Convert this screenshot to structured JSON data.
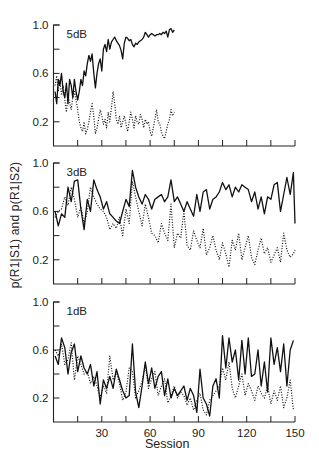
{
  "figure": {
    "ylabel": "p(R1|S1) and p(R1|S2)",
    "xlabel": "Session"
  },
  "chart_data": [
    {
      "type": "line",
      "title": "5 dB",
      "xlabel": "Session",
      "ylabel": "p(R1|S1) and p(R1|S2)",
      "xlim": [
        0,
        150
      ],
      "ylim": [
        0,
        1.0
      ],
      "yticks": [
        0.2,
        0.4,
        0.6,
        0.8,
        1.0
      ],
      "ytick_labels": [
        "0.2",
        "",
        "0.6",
        "",
        "1.0"
      ],
      "xticks": [
        15,
        30,
        45,
        60,
        75,
        90,
        105,
        120,
        135,
        150
      ],
      "xtick_labels": [],
      "grid": false,
      "series": [
        {
          "name": "p(R1|S1)",
          "style": "solid",
          "x": [
            1,
            2,
            3,
            4,
            5,
            6,
            7,
            8,
            9,
            10,
            11,
            12,
            13,
            14,
            15,
            16,
            17,
            18,
            19,
            20,
            21,
            22,
            23,
            24,
            25,
            26,
            27,
            28,
            29,
            30,
            31,
            32,
            33,
            34,
            35,
            36,
            37,
            38,
            39,
            40,
            41,
            42,
            43,
            44,
            45,
            46,
            47,
            48,
            49,
            50,
            51,
            52,
            53,
            54,
            55,
            56,
            57,
            58,
            59,
            60,
            61,
            62,
            63,
            64,
            65,
            66,
            67,
            68,
            69,
            70,
            71,
            72,
            73,
            74,
            75
          ],
          "values": [
            0.45,
            0.35,
            0.55,
            0.5,
            0.6,
            0.45,
            0.4,
            0.52,
            0.35,
            0.55,
            0.5,
            0.4,
            0.55,
            0.45,
            0.38,
            0.45,
            0.55,
            0.5,
            0.62,
            0.58,
            0.68,
            0.75,
            0.7,
            0.76,
            0.6,
            0.48,
            0.6,
            0.68,
            0.72,
            0.62,
            0.8,
            0.84,
            0.78,
            0.88,
            0.8,
            0.86,
            0.88,
            0.9,
            0.87,
            0.85,
            0.83,
            0.79,
            0.72,
            0.85,
            0.9,
            0.89,
            0.87,
            0.88,
            0.84,
            0.82,
            0.85,
            0.84,
            0.86,
            0.87,
            0.88,
            0.9,
            0.94,
            0.92,
            0.9,
            0.92,
            0.93,
            0.92,
            0.91,
            0.92,
            0.92,
            0.93,
            0.92,
            0.94,
            0.93,
            0.95,
            0.9,
            0.96,
            0.97,
            0.94,
            0.96
          ]
        },
        {
          "name": "p(R1|S2)",
          "style": "dotted",
          "x": [
            1,
            2,
            3,
            4,
            5,
            6,
            7,
            8,
            9,
            10,
            11,
            12,
            13,
            14,
            15,
            16,
            17,
            18,
            19,
            20,
            21,
            22,
            23,
            24,
            25,
            26,
            27,
            28,
            29,
            30,
            31,
            32,
            33,
            34,
            35,
            36,
            37,
            38,
            39,
            40,
            41,
            42,
            43,
            44,
            45,
            46,
            47,
            48,
            49,
            50,
            51,
            52,
            53,
            54,
            55,
            56,
            57,
            58,
            59,
            60,
            61,
            62,
            63,
            64,
            65,
            66,
            67,
            68,
            69,
            70,
            71,
            72,
            73,
            74,
            75
          ],
          "values": [
            0.5,
            0.58,
            0.45,
            0.55,
            0.42,
            0.5,
            0.38,
            0.28,
            0.42,
            0.36,
            0.3,
            0.4,
            0.45,
            0.38,
            0.3,
            0.2,
            0.15,
            0.12,
            0.2,
            0.1,
            0.14,
            0.2,
            0.28,
            0.35,
            0.25,
            0.1,
            0.15,
            0.22,
            0.3,
            0.25,
            0.18,
            0.22,
            0.15,
            0.28,
            0.2,
            0.32,
            0.45,
            0.35,
            0.22,
            0.18,
            0.25,
            0.15,
            0.2,
            0.25,
            0.18,
            0.12,
            0.2,
            0.28,
            0.22,
            0.15,
            0.25,
            0.2,
            0.18,
            0.26,
            0.22,
            0.15,
            0.22,
            0.18,
            0.2,
            0.12,
            0.08,
            0.15,
            0.22,
            0.3,
            0.2,
            0.18,
            0.12,
            0.08,
            0.06,
            0.12,
            0.18,
            0.22,
            0.3,
            0.25,
            0.28
          ]
        }
      ]
    },
    {
      "type": "line",
      "title": "3 dB",
      "xlabel": "Session",
      "ylabel": "p(R1|S1) and p(R1|S2)",
      "xlim": [
        0,
        150
      ],
      "ylim": [
        0,
        1.0
      ],
      "yticks": [
        0.2,
        0.4,
        0.6,
        0.8,
        1.0
      ],
      "ytick_labels": [
        "0.2",
        "",
        "0.6",
        "",
        "1.0"
      ],
      "xticks": [
        15,
        30,
        45,
        60,
        75,
        90,
        105,
        120,
        135,
        150
      ],
      "xtick_labels": [],
      "grid": false,
      "series": [
        {
          "name": "p(R1|S1)",
          "style": "solid",
          "x": [
            1,
            3,
            5,
            7,
            9,
            11,
            13,
            15,
            17,
            19,
            21,
            23,
            25,
            27,
            29,
            31,
            33,
            35,
            37,
            39,
            41,
            43,
            45,
            47,
            49,
            51,
            53,
            55,
            57,
            59,
            61,
            63,
            65,
            67,
            69,
            71,
            73,
            75,
            77,
            79,
            81,
            83,
            85,
            87,
            89,
            91,
            93,
            95,
            97,
            99,
            101,
            103,
            105,
            107,
            109,
            111,
            113,
            115,
            117,
            119,
            121,
            123,
            125,
            127,
            129,
            131,
            133,
            135,
            137,
            139,
            141,
            143,
            145,
            147,
            149,
            150
          ],
          "values": [
            0.6,
            0.48,
            0.58,
            0.55,
            0.8,
            0.68,
            0.85,
            0.86,
            0.62,
            0.45,
            0.7,
            0.6,
            0.86,
            0.78,
            0.72,
            0.62,
            0.68,
            0.58,
            0.55,
            0.52,
            0.5,
            0.6,
            0.7,
            0.64,
            0.94,
            0.8,
            0.72,
            0.66,
            0.74,
            0.7,
            0.62,
            0.7,
            0.72,
            0.74,
            0.68,
            0.72,
            0.86,
            0.68,
            0.72,
            0.66,
            0.6,
            0.68,
            0.62,
            0.56,
            0.74,
            0.6,
            0.76,
            0.78,
            0.62,
            0.7,
            0.72,
            0.76,
            0.84,
            0.78,
            0.82,
            0.72,
            0.8,
            0.76,
            0.82,
            0.8,
            0.78,
            0.68,
            0.76,
            0.62,
            0.72,
            0.58,
            0.72,
            0.7,
            0.82,
            0.84,
            0.6,
            0.74,
            0.88,
            0.74,
            0.92,
            0.5
          ]
        },
        {
          "name": "p(R1|S2)",
          "style": "dotted",
          "x": [
            1,
            3,
            5,
            7,
            9,
            11,
            13,
            15,
            17,
            19,
            21,
            23,
            25,
            27,
            29,
            31,
            33,
            35,
            37,
            39,
            41,
            43,
            45,
            47,
            49,
            51,
            53,
            55,
            57,
            59,
            61,
            63,
            65,
            67,
            69,
            71,
            73,
            75,
            77,
            79,
            81,
            83,
            85,
            87,
            89,
            91,
            93,
            95,
            97,
            99,
            101,
            103,
            105,
            107,
            109,
            111,
            113,
            115,
            117,
            119,
            121,
            123,
            125,
            127,
            129,
            131,
            133,
            135,
            137,
            139,
            141,
            143,
            145,
            147,
            149,
            150
          ],
          "values": [
            0.55,
            0.6,
            0.62,
            0.72,
            0.65,
            0.8,
            0.7,
            0.55,
            0.64,
            0.5,
            0.6,
            0.8,
            0.72,
            0.66,
            0.62,
            0.6,
            0.55,
            0.45,
            0.5,
            0.46,
            0.55,
            0.4,
            0.62,
            0.5,
            0.85,
            0.72,
            0.6,
            0.48,
            0.66,
            0.55,
            0.42,
            0.4,
            0.34,
            0.5,
            0.42,
            0.36,
            0.66,
            0.3,
            0.42,
            0.38,
            0.6,
            0.32,
            0.28,
            0.44,
            0.36,
            0.3,
            0.46,
            0.24,
            0.3,
            0.4,
            0.28,
            0.2,
            0.34,
            0.25,
            0.14,
            0.36,
            0.28,
            0.42,
            0.2,
            0.3,
            0.4,
            0.22,
            0.16,
            0.28,
            0.38,
            0.25,
            0.3,
            0.18,
            0.24,
            0.3,
            0.18,
            0.42,
            0.28,
            0.22,
            0.25,
            0.28
          ]
        }
      ]
    },
    {
      "type": "line",
      "title": "1 dB",
      "xlabel": "Session",
      "ylabel": "p(R1|S1) and p(R1|S2)",
      "xlim": [
        0,
        150
      ],
      "ylim": [
        0,
        1.0
      ],
      "yticks": [
        0.2,
        0.4,
        0.6,
        0.8,
        1.0
      ],
      "ytick_labels": [
        "0.2",
        "",
        "0.6",
        "",
        "1.0"
      ],
      "xticks": [
        15,
        30,
        45,
        60,
        75,
        90,
        105,
        120,
        135,
        150
      ],
      "xtick_labels": [
        "",
        "30",
        "",
        "60",
        "",
        "90",
        "",
        "120",
        "",
        "150"
      ],
      "grid": false,
      "series": [
        {
          "name": "p(R1|S1)",
          "style": "solid",
          "x": [
            1,
            3,
            5,
            7,
            9,
            11,
            13,
            15,
            17,
            19,
            21,
            23,
            25,
            27,
            29,
            31,
            33,
            35,
            37,
            39,
            41,
            43,
            45,
            47,
            49,
            51,
            53,
            55,
            57,
            59,
            61,
            63,
            65,
            67,
            69,
            71,
            73,
            75,
            77,
            79,
            81,
            83,
            85,
            87,
            89,
            91,
            93,
            95,
            97,
            99,
            101,
            103,
            105,
            107,
            109,
            111,
            113,
            115,
            117,
            119,
            121,
            123,
            125,
            127,
            129,
            131,
            133,
            135,
            137,
            139,
            141,
            143,
            145,
            147,
            149
          ],
          "values": [
            0.55,
            0.48,
            0.7,
            0.62,
            0.4,
            0.58,
            0.65,
            0.42,
            0.55,
            0.45,
            0.4,
            0.48,
            0.3,
            0.42,
            0.15,
            0.35,
            0.28,
            0.38,
            0.28,
            0.44,
            0.35,
            0.26,
            0.2,
            0.22,
            0.65,
            0.25,
            0.12,
            0.3,
            0.5,
            0.32,
            0.45,
            0.28,
            0.38,
            0.42,
            0.22,
            0.36,
            0.2,
            0.28,
            0.22,
            0.26,
            0.3,
            0.18,
            0.28,
            0.22,
            0.08,
            0.44,
            0.2,
            0.15,
            0.05,
            0.3,
            0.36,
            0.2,
            0.72,
            0.45,
            0.7,
            0.5,
            0.6,
            0.35,
            0.68,
            0.4,
            0.7,
            0.38,
            0.4,
            0.6,
            0.3,
            0.5,
            0.25,
            0.7,
            0.48,
            0.62,
            0.42,
            0.65,
            0.3,
            0.6,
            0.68
          ]
        },
        {
          "name": "p(R1|S2)",
          "style": "dotted",
          "x": [
            1,
            3,
            5,
            7,
            9,
            11,
            13,
            15,
            17,
            19,
            21,
            23,
            25,
            27,
            29,
            31,
            33,
            35,
            37,
            39,
            41,
            43,
            45,
            47,
            49,
            51,
            53,
            55,
            57,
            59,
            61,
            63,
            65,
            67,
            69,
            71,
            73,
            75,
            77,
            79,
            81,
            83,
            85,
            87,
            89,
            91,
            93,
            95,
            97,
            99,
            101,
            103,
            105,
            107,
            109,
            111,
            113,
            115,
            117,
            119,
            121,
            123,
            125,
            127,
            129,
            131,
            133,
            135,
            137,
            139,
            141,
            143,
            145,
            147,
            149
          ],
          "values": [
            0.6,
            0.55,
            0.65,
            0.48,
            0.52,
            0.66,
            0.35,
            0.55,
            0.48,
            0.4,
            0.42,
            0.32,
            0.38,
            0.3,
            0.2,
            0.3,
            0.24,
            0.55,
            0.35,
            0.42,
            0.32,
            0.18,
            0.25,
            0.45,
            0.42,
            0.2,
            0.26,
            0.34,
            0.48,
            0.28,
            0.36,
            0.42,
            0.22,
            0.3,
            0.36,
            0.16,
            0.22,
            0.3,
            0.2,
            0.25,
            0.22,
            0.14,
            0.2,
            0.1,
            0.18,
            0.24,
            0.1,
            0.06,
            0.18,
            0.22,
            0.26,
            0.3,
            0.45,
            0.35,
            0.5,
            0.28,
            0.2,
            0.3,
            0.4,
            0.22,
            0.32,
            0.26,
            0.18,
            0.3,
            0.24,
            0.2,
            0.3,
            0.15,
            0.26,
            0.18,
            0.3,
            0.12,
            0.2,
            0.35,
            0.1
          ]
        }
      ]
    }
  ]
}
